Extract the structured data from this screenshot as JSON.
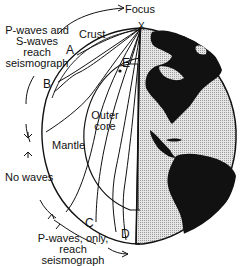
{
  "diagram": {
    "type": "seismic wave paths through Earth's interior",
    "labels": {
      "focus": "Focus",
      "crust": "Crust",
      "mantle": "Mantle",
      "outer_core_line1": "Outer",
      "outer_core_line2": "core",
      "no_waves": "No waves",
      "ps_line1": "P-waves and",
      "ps_line2": "S-waves",
      "ps_line3": "reach",
      "ps_line4": "seismograph",
      "p_line1": "P-waves, only,",
      "p_line2": "reach",
      "p_line3": "seismograph"
    },
    "points": {
      "a": "A",
      "b": "B",
      "c": "C",
      "d": "D",
      "e": "E",
      "focus_marker": "X"
    },
    "colors": {
      "line": "#111111",
      "land": "#111111",
      "ocean": "#c8c8c8",
      "background": "#ffffff"
    }
  }
}
